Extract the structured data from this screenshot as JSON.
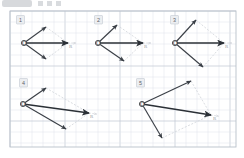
{
  "page": {
    "width": 244,
    "height": 158
  },
  "decor": {
    "top_artifact_name": "header-smudge",
    "top_dots_name": "header-dots"
  },
  "colors": {
    "paper": "#ffffff",
    "grid_minor": "#dfe3ea",
    "grid_major": "#c3c9d4",
    "frame": "#b9c0cb",
    "vector": "#3a3f46",
    "resultant": "#2b3036",
    "construction": "#d5d8dd",
    "label_box_bg": "#eceef1",
    "label_text": "#5d6167",
    "point_fill": "#ffffff",
    "point_stroke": "#2f3338"
  },
  "grid": {
    "cell": 11,
    "frame": {
      "x": 10,
      "y": 11,
      "w": 226,
      "h": 136
    },
    "major_every": 5
  },
  "origin_label": "O",
  "resultant_label": "R",
  "panels": [
    {
      "number": "1",
      "label": "1",
      "label_pos": {
        "x": 18,
        "y": 17
      },
      "origin": {
        "x": 24,
        "y": 43
      },
      "v1": {
        "x": 46,
        "y": 27
      },
      "v2": {
        "x": 46,
        "y": 59
      },
      "resultant": {
        "x": 68,
        "y": 43
      },
      "angle_note": "narrow-symmetric",
      "resultant_label_pos": {
        "x": 69,
        "y": 48
      }
    },
    {
      "number": "2",
      "label": "2",
      "label_pos": {
        "x": 96,
        "y": 17
      },
      "origin": {
        "x": 98,
        "y": 43
      },
      "v1": {
        "x": 117,
        "y": 25
      },
      "v2": {
        "x": 124,
        "y": 61
      },
      "resultant": {
        "x": 143,
        "y": 43
      },
      "angle_note": "medium",
      "resultant_label_pos": {
        "x": 144,
        "y": 48
      }
    },
    {
      "number": "3",
      "label": "3",
      "label_pos": {
        "x": 172,
        "y": 17
      },
      "origin": {
        "x": 175,
        "y": 43
      },
      "v1": {
        "x": 196,
        "y": 20
      },
      "v2": {
        "x": 203,
        "y": 67
      },
      "resultant": {
        "x": 224,
        "y": 43
      },
      "angle_note": "wide",
      "resultant_label_pos": {
        "x": 225,
        "y": 48
      }
    },
    {
      "number": "4",
      "label": "4",
      "label_pos": {
        "x": 21,
        "y": 80
      },
      "origin": {
        "x": 23,
        "y": 104
      },
      "v1": {
        "x": 46,
        "y": 88
      },
      "v2": {
        "x": 66,
        "y": 129
      },
      "resultant": {
        "x": 89,
        "y": 113
      },
      "angle_note": "oblique-narrow",
      "resultant_label_pos": {
        "x": 90,
        "y": 118
      }
    },
    {
      "number": "5",
      "label": "5",
      "label_pos": {
        "x": 138,
        "y": 80
      },
      "origin": {
        "x": 142,
        "y": 104
      },
      "v1": {
        "x": 191,
        "y": 81
      },
      "v2": {
        "x": 162,
        "y": 138
      },
      "resultant": {
        "x": 211,
        "y": 115
      },
      "angle_note": "very-wide",
      "resultant_label_pos": {
        "x": 213,
        "y": 120
      }
    }
  ]
}
